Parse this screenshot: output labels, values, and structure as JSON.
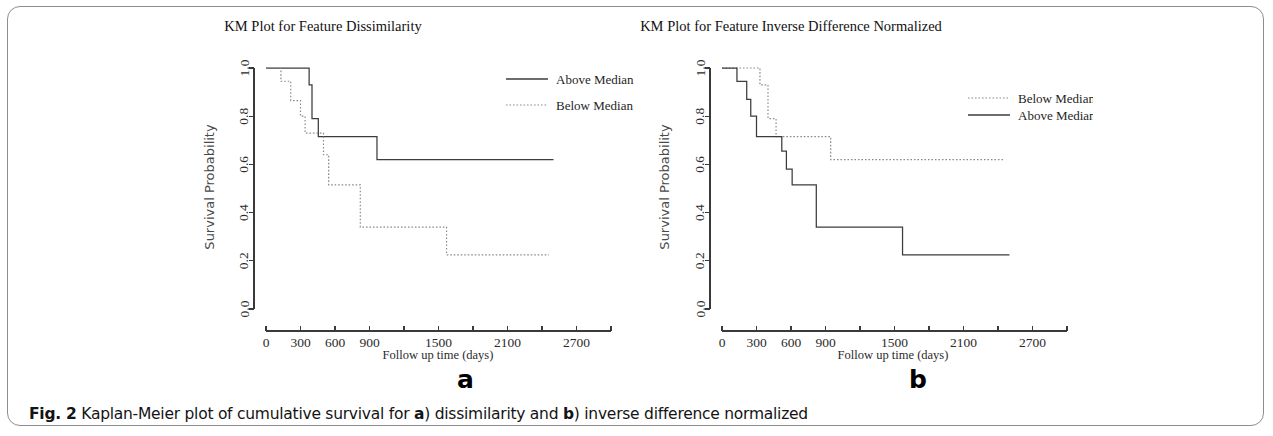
{
  "figure": {
    "caption_label": "Fig. 2",
    "caption_part1": " Kaplan-Meier plot of cumulative survival for ",
    "caption_ref_a": "a",
    "caption_part2": ") dissimilarity and ",
    "caption_ref_b": "b",
    "caption_part3": ") inverse difference normalized",
    "panel_a_letter": "a",
    "panel_b_letter": "b",
    "line_color_solid": "#3c3c3c",
    "line_color_dotted": "#8a8a8a",
    "axis_color": "#3a3a3a"
  },
  "chart_data": [
    {
      "type": "line",
      "panel": "a",
      "title": "KM Plot for Feature Dissimilarity",
      "xlabel": "Follow up time (days)",
      "ylabel": "Survival Probability",
      "xlim": [
        0,
        3000
      ],
      "ylim": [
        0,
        1
      ],
      "xticks": [
        0,
        300,
        600,
        900,
        1200,
        1500,
        1800,
        2100,
        2400,
        2700,
        3000
      ],
      "xtick_labels": [
        "0",
        "300",
        "600",
        "900",
        "",
        "1500",
        "",
        "2100",
        "",
        "2700",
        ""
      ],
      "yticks": [
        0.0,
        0.2,
        0.4,
        0.6,
        0.8,
        1.0
      ],
      "ytick_labels": [
        "0.0",
        "0.2",
        "0.4",
        "0.6",
        "0.8",
        "1.0"
      ],
      "grid": false,
      "legend_position": "top-right",
      "series": [
        {
          "name": "Above Median",
          "style": "solid",
          "x": [
            0,
            375,
            375,
            400,
            400,
            455,
            455,
            530,
            530,
            965,
            965,
            2500
          ],
          "y": [
            1.0,
            1.0,
            0.93,
            0.93,
            0.79,
            0.79,
            0.715,
            0.715,
            0.715,
            0.715,
            0.62,
            0.62
          ]
        },
        {
          "name": "Below Median",
          "style": "dotted",
          "x": [
            0,
            130,
            130,
            215,
            215,
            300,
            300,
            340,
            340,
            470,
            470,
            500,
            500,
            545,
            545,
            820,
            820,
            1570,
            1570,
            2460
          ],
          "y": [
            1.0,
            1.0,
            0.945,
            0.945,
            0.865,
            0.865,
            0.8,
            0.8,
            0.73,
            0.73,
            0.73,
            0.73,
            0.64,
            0.64,
            0.515,
            0.515,
            0.34,
            0.34,
            0.225,
            0.225
          ]
        }
      ]
    },
    {
      "type": "line",
      "panel": "b",
      "title": "KM Plot for Feature Inverse Difference Normalized",
      "xlabel": "Follow up time (days)",
      "ylabel": "Survival Probability",
      "xlim": [
        0,
        3000
      ],
      "ylim": [
        0,
        1
      ],
      "xticks": [
        0,
        300,
        600,
        900,
        1200,
        1500,
        1800,
        2100,
        2400,
        2700,
        3000
      ],
      "xtick_labels": [
        "0",
        "300",
        "600",
        "900",
        "",
        "1500",
        "",
        "2100",
        "",
        "2700",
        ""
      ],
      "yticks": [
        0.0,
        0.2,
        0.4,
        0.6,
        0.8,
        1.0
      ],
      "ytick_labels": [
        "0.0",
        "0.2",
        "0.4",
        "0.6",
        "0.8",
        "1.0"
      ],
      "grid": false,
      "legend_position": "top-right",
      "series": [
        {
          "name": "Below Median",
          "style": "dotted",
          "x": [
            0,
            330,
            330,
            400,
            400,
            470,
            470,
            545,
            545,
            945,
            945,
            2460
          ],
          "y": [
            1.0,
            1.0,
            0.93,
            0.93,
            0.79,
            0.79,
            0.715,
            0.715,
            0.715,
            0.715,
            0.62,
            0.62
          ]
        },
        {
          "name": "Above Median",
          "style": "solid",
          "x": [
            0,
            130,
            130,
            215,
            215,
            250,
            250,
            300,
            300,
            350,
            350,
            520,
            520,
            560,
            560,
            610,
            610,
            820,
            820,
            1570,
            1570,
            2500
          ],
          "y": [
            1.0,
            1.0,
            0.945,
            0.945,
            0.87,
            0.87,
            0.8,
            0.8,
            0.715,
            0.715,
            0.715,
            0.715,
            0.655,
            0.655,
            0.58,
            0.58,
            0.515,
            0.515,
            0.34,
            0.34,
            0.225,
            0.225
          ]
        }
      ]
    }
  ]
}
